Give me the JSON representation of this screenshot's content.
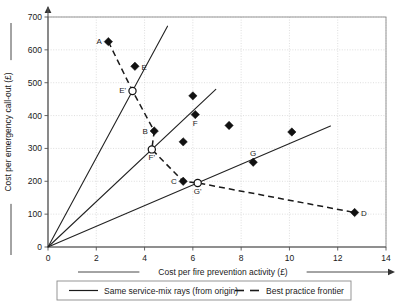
{
  "chart_data": {
    "type": "scatter",
    "title": "",
    "xlabel": "Cost per fire prevention activity (£)",
    "ylabel": "Cost per emergency call-out (£)",
    "xlim": [
      0,
      14
    ],
    "ylim": [
      0,
      700
    ],
    "xticks": [
      0,
      2,
      4,
      6,
      8,
      10,
      12,
      14
    ],
    "yticks": [
      0,
      100,
      200,
      300,
      400,
      500,
      600,
      700
    ],
    "xtick_labels": [
      "0",
      "2",
      "4",
      "6",
      "8",
      "10",
      "12",
      "14"
    ],
    "ytick_labels": [
      "0",
      "100",
      "200",
      "300",
      "400",
      "500",
      "600",
      "700"
    ],
    "grid": true,
    "legend_position": "bottom",
    "series": [
      {
        "name": "Observed units",
        "marker": "filled-diamond",
        "points": [
          {
            "label": "A",
            "x": 2.5,
            "y": 625,
            "label_pos": "left"
          },
          {
            "label": "E",
            "x": 3.6,
            "y": 550,
            "label_pos": "right"
          },
          {
            "label": "B",
            "x": 4.4,
            "y": 353,
            "label_pos": "left"
          },
          {
            "label": "",
            "x": 6.0,
            "y": 460,
            "label_pos": "right"
          },
          {
            "label": "F",
            "x": 6.1,
            "y": 403,
            "label_pos": "below"
          },
          {
            "label": "",
            "x": 7.5,
            "y": 370,
            "label_pos": "right"
          },
          {
            "label": "",
            "x": 5.6,
            "y": 320,
            "label_pos": "right"
          },
          {
            "label": "C",
            "x": 5.6,
            "y": 200,
            "label_pos": "left"
          },
          {
            "label": "G",
            "x": 8.5,
            "y": 258,
            "label_pos": "above"
          },
          {
            "label": "",
            "x": 10.1,
            "y": 350,
            "label_pos": "right"
          },
          {
            "label": "D",
            "x": 12.7,
            "y": 105,
            "label_pos": "right"
          }
        ]
      },
      {
        "name": "Frontier projections",
        "marker": "open-circle",
        "points": [
          {
            "label": "E'",
            "x": 3.5,
            "y": 475,
            "label_pos": "left"
          },
          {
            "label": "F'",
            "x": 4.3,
            "y": 297,
            "label_pos": "below"
          },
          {
            "label": "G'",
            "x": 6.2,
            "y": 195,
            "label_pos": "below"
          }
        ]
      }
    ],
    "rays": [
      {
        "name": "ray-through-E-prime",
        "x0": 0,
        "y0": 0,
        "x1": 4.95,
        "y1": 672
      },
      {
        "name": "ray-through-F-prime",
        "x0": 0,
        "y0": 0,
        "x1": 6.95,
        "y1": 480
      },
      {
        "name": "ray-through-G-prime",
        "x0": 0,
        "y0": 0,
        "x1": 11.7,
        "y1": 368
      }
    ],
    "frontier_path": [
      {
        "label": "A",
        "x": 2.5,
        "y": 625
      },
      {
        "label": "E'",
        "x": 3.5,
        "y": 475
      },
      {
        "label": "B",
        "x": 4.4,
        "y": 353
      },
      {
        "label": "F'",
        "x": 4.3,
        "y": 297
      },
      {
        "label": "C",
        "x": 5.6,
        "y": 200
      },
      {
        "label": "G'",
        "x": 6.2,
        "y": 195
      },
      {
        "label": "D",
        "x": 12.7,
        "y": 105
      }
    ],
    "annotations": []
  },
  "legend": {
    "entries": [
      {
        "label": "Same service-mix rays (from origin)",
        "style": "solid"
      },
      {
        "label": "Best practice frontier",
        "style": "dashed"
      }
    ]
  },
  "axes": {
    "x_axis_title": "Cost per fire prevention activity (£)",
    "y_axis_title": "Cost per emergency call-out (£)"
  }
}
